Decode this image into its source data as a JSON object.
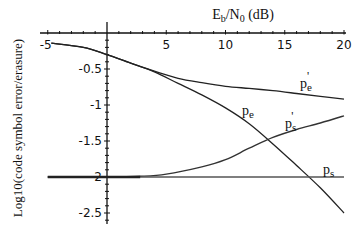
{
  "chart_data": {
    "type": "line",
    "title": "Eb/N0 (dB)",
    "title_parts": {
      "base": "E",
      "sub1": "b",
      "mid": "/N",
      "sub2": "0",
      "tail": " (dB)"
    },
    "xlabel": "Eb/N0 (dB)",
    "ylabel": "Log10(code symbol error/erasure)",
    "xlim": [
      -5,
      20
    ],
    "ylim": [
      -2.5,
      0
    ],
    "x_ticks": [
      -5,
      5,
      10,
      15,
      20
    ],
    "x_tick_labels": [
      "-5",
      "5",
      "10",
      "15",
      "20"
    ],
    "y_ticks": [
      -0.5,
      -1,
      -1.5,
      -2,
      -2.5
    ],
    "y_tick_labels": [
      "-0.5",
      "-1",
      "-1.5",
      "-2",
      "-2.5"
    ],
    "x_axis_position": "top (y=0)",
    "y_axis_position": "x=0",
    "grid": false,
    "legend": "inline labels",
    "series": [
      {
        "name": "pe'",
        "label": {
          "base": "p",
          "sub": "e",
          "prime": "'"
        },
        "x": [
          -4.7,
          -2,
          0,
          2,
          4,
          6,
          8,
          10,
          12,
          14,
          16,
          18,
          20
        ],
        "values": [
          -0.14,
          -0.2,
          -0.3,
          -0.42,
          -0.53,
          -0.63,
          -0.69,
          -0.74,
          -0.77,
          -0.8,
          -0.84,
          -0.88,
          -0.92
        ]
      },
      {
        "name": "pe",
        "label": {
          "base": "p",
          "sub": "e",
          "prime": ""
        },
        "x": [
          -4.7,
          -2,
          0,
          2,
          4,
          6,
          8,
          10,
          12,
          14,
          16,
          18,
          20
        ],
        "values": [
          -0.14,
          -0.2,
          -0.3,
          -0.42,
          -0.54,
          -0.7,
          -0.86,
          -1.04,
          -1.26,
          -1.54,
          -1.84,
          -2.15,
          -2.5
        ]
      },
      {
        "name": "ps'",
        "label": {
          "base": "p",
          "sub": "s",
          "prime": "'"
        },
        "x": [
          -5,
          0,
          2.8,
          5,
          8,
          10,
          12,
          14,
          16,
          18,
          20
        ],
        "values": [
          -2.0,
          -2.0,
          -1.99,
          -1.96,
          -1.86,
          -1.76,
          -1.6,
          -1.45,
          -1.34,
          -1.25,
          -1.15
        ]
      },
      {
        "name": "ps",
        "label": {
          "base": "p",
          "sub": "s",
          "prime": ""
        },
        "x": [
          -5,
          20
        ],
        "values": [
          -2.0,
          -2.0
        ]
      }
    ]
  }
}
